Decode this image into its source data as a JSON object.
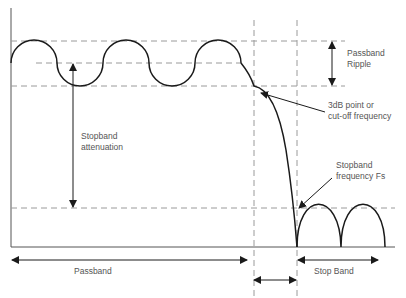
{
  "diagram": {
    "colors": {
      "curve": "#1a1a1a",
      "dashed": "#9a9a9a",
      "axis": "#555555",
      "text": "#555555"
    },
    "labels": {
      "passband_ripple_line1": "Passband",
      "passband_ripple_line2": "Ripple",
      "cutoff_line1": "3dB point or",
      "cutoff_line2": "cut-off frequency",
      "stopband_atten_line1": "Stopband",
      "stopband_atten_line2": "attenuation",
      "stopband_freq_line1": "Stopband",
      "stopband_freq_line2": "frequency Fs",
      "passband": "Passband",
      "stop_band": "Stop Band"
    }
  }
}
